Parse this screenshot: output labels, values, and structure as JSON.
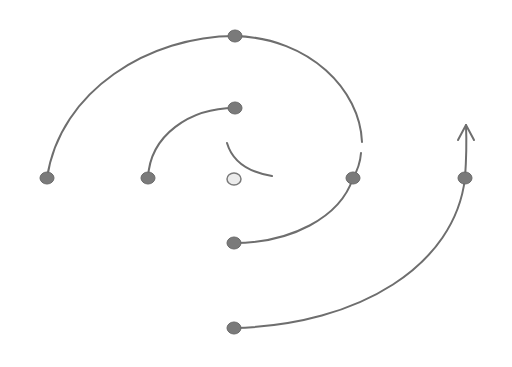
{
  "diagram": {
    "type": "spiral",
    "colors": {
      "background": "#ffffff",
      "line": "#6e6e6e",
      "node_fill": "#7a7a7a",
      "center_node_fill": "#ececec"
    },
    "nodes": [
      {
        "id": "center",
        "x": 234,
        "y": 179,
        "style": "light"
      },
      {
        "id": "inner-top",
        "x": 235,
        "y": 108,
        "style": "dark"
      },
      {
        "id": "inner-left",
        "x": 148,
        "y": 178,
        "style": "dark"
      },
      {
        "id": "outer-left",
        "x": 47,
        "y": 178,
        "style": "dark"
      },
      {
        "id": "outer-top",
        "x": 235,
        "y": 36,
        "style": "dark"
      },
      {
        "id": "right-mid",
        "x": 353,
        "y": 178,
        "style": "dark"
      },
      {
        "id": "bottom-mid",
        "x": 234,
        "y": 243,
        "style": "dark"
      },
      {
        "id": "far-right",
        "x": 465,
        "y": 178,
        "style": "dark"
      },
      {
        "id": "bottom-outer",
        "x": 234,
        "y": 328,
        "style": "dark"
      }
    ],
    "arrow": {
      "direction": "up",
      "tip_x": 466,
      "tip_y": 125
    }
  }
}
